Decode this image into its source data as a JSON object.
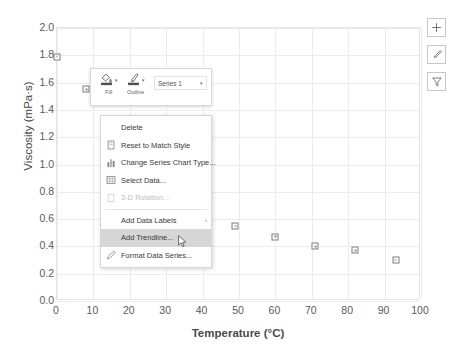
{
  "chart_data": {
    "type": "scatter",
    "title": "",
    "xlabel": "Temperature (°C)",
    "ylabel": "Viscosity (mPa·s)",
    "xlim": [
      0,
      100
    ],
    "ylim": [
      0.0,
      2.0
    ],
    "xticks": [
      "0",
      "10",
      "20",
      "30",
      "40",
      "50",
      "60",
      "70",
      "80",
      "90",
      "100"
    ],
    "yticks": [
      "0.0",
      "0.2",
      "0.4",
      "0.6",
      "0.8",
      "1.0",
      "1.2",
      "1.4",
      "1.6",
      "1.8",
      "2.0"
    ],
    "grid": true,
    "legend": "none",
    "marker_color": "#7d7d7d",
    "series": [
      {
        "name": "Series 1",
        "points": [
          {
            "x": 0,
            "y": 1.79
          },
          {
            "x": 8,
            "y": 1.55
          },
          {
            "x": 17,
            "y": 1.3
          },
          {
            "x": 49,
            "y": 0.55
          },
          {
            "x": 60,
            "y": 0.47
          },
          {
            "x": 71,
            "y": 0.4
          },
          {
            "x": 82,
            "y": 0.37
          },
          {
            "x": 93,
            "y": 0.3
          }
        ]
      }
    ]
  },
  "chart_buttons": [
    {
      "name": "chart-elements-button",
      "glyph": "＋"
    },
    {
      "name": "chart-styles-button",
      "glyph": "✎"
    },
    {
      "name": "chart-filters-button",
      "glyph": "∇"
    }
  ],
  "mini_toolbar": {
    "fill_label": "Fill",
    "outline_label": "Outline",
    "caret": "▾",
    "series_selector": {
      "value": "Series 1",
      "caret": "▾"
    }
  },
  "context_menu": {
    "items": [
      {
        "label": "Delete",
        "icon": "none",
        "enabled": true,
        "highlighted": false,
        "submenu": false
      },
      {
        "label": "Reset to Match Style",
        "icon": "reset-style-icon",
        "enabled": true,
        "highlighted": false,
        "submenu": false
      },
      {
        "label": "Change Series Chart Type...",
        "icon": "chart-type-icon",
        "enabled": true,
        "highlighted": false,
        "submenu": false
      },
      {
        "label": "Select Data...",
        "icon": "select-data-icon",
        "enabled": true,
        "highlighted": false,
        "submenu": false
      },
      {
        "label": "3-D Rotation...",
        "icon": "rotation-icon",
        "enabled": false,
        "highlighted": false,
        "submenu": false
      },
      {
        "label": "Add Data Labels",
        "icon": "none",
        "enabled": true,
        "highlighted": false,
        "submenu": true
      },
      {
        "label": "Add Trendline...",
        "icon": "none",
        "enabled": true,
        "highlighted": true,
        "submenu": false
      },
      {
        "label": "Format Data Series...",
        "icon": "format-series-icon",
        "enabled": true,
        "highlighted": false,
        "submenu": false
      }
    ],
    "submenu_arrow": "›"
  }
}
